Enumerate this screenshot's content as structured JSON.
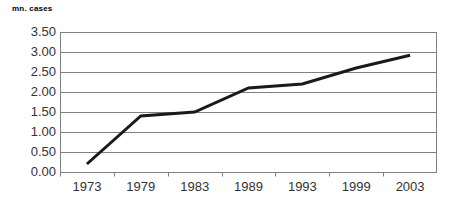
{
  "chart_data": {
    "type": "line",
    "title": "mn. cases",
    "xlabel": "",
    "ylabel": "mn. cases",
    "categories": [
      "1973",
      "1979",
      "1983",
      "1989",
      "1993",
      "1999",
      "2003"
    ],
    "values": [
      0.2,
      1.4,
      1.5,
      2.1,
      2.2,
      2.6,
      2.92
    ],
    "series": [
      {
        "name": "mn. cases",
        "values": [
          0.2,
          1.4,
          1.5,
          2.1,
          2.2,
          2.6,
          2.92
        ],
        "color": "#1a1a1a"
      }
    ],
    "ylim": [
      0.0,
      3.5
    ],
    "ytick_step": 0.5,
    "ytick_labels": [
      "3.50",
      "3.00",
      "2.50",
      "2.00",
      "1.50",
      "1.00",
      "0.50",
      "0.00"
    ],
    "ytick_values": [
      3.5,
      3.0,
      2.5,
      2.0,
      1.5,
      1.0,
      0.5,
      0.0
    ],
    "grid": true,
    "grid_axis": "y",
    "grid_color": "#808080",
    "axis_color": "#808080",
    "legend": false,
    "legend_position": "none",
    "markers": false,
    "line_width_px": 3,
    "background": "#ffffff"
  },
  "axis_title": {
    "text": "mn. cases"
  }
}
